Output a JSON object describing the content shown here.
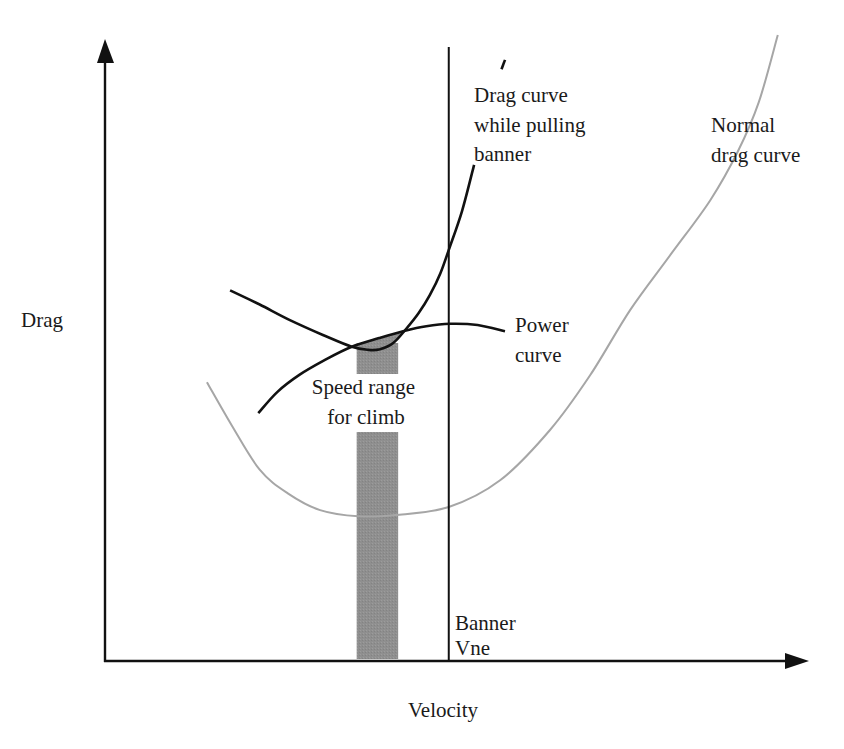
{
  "chart_data": {
    "type": "line",
    "title": "",
    "xlabel": "Velocity",
    "ylabel": "Drag",
    "xlim": [
      0,
      100
    ],
    "ylim": [
      0,
      100
    ],
    "grid": false,
    "ticks": "none",
    "series": [
      {
        "name": "Normal drag curve",
        "label_lines": [
          "Normal",
          "drag curve"
        ],
        "color": "#a6a6a6",
        "points": [
          [
            14.5,
            44.9
          ],
          [
            18,
            38
          ],
          [
            22,
            30.8
          ],
          [
            26,
            27
          ],
          [
            30.6,
            24.3
          ],
          [
            36,
            23.3
          ],
          [
            41.3,
            23.5
          ],
          [
            48.9,
            24.8
          ],
          [
            56.2,
            29.1
          ],
          [
            63.3,
            37.2
          ],
          [
            69,
            46
          ],
          [
            74.7,
            56.5
          ],
          [
            80.5,
            65.5
          ],
          [
            86.1,
            74.2
          ],
          [
            90,
            82
          ],
          [
            93,
            90
          ],
          [
            95.7,
            100.8
          ]
        ]
      },
      {
        "name": "Drag curve while pulling banner",
        "label_lines": [
          "Drag curve",
          "while pulling",
          "banner"
        ],
        "color": "#111111",
        "points": [
          [
            17.8,
            59.7
          ],
          [
            22,
            57.4
          ],
          [
            26.3,
            54.9
          ],
          [
            31,
            52.5
          ],
          [
            35.1,
            50.6
          ],
          [
            37.5,
            50.1
          ],
          [
            39.1,
            50.2
          ],
          [
            41,
            51.2
          ],
          [
            42.7,
            53.3
          ],
          [
            44.6,
            56
          ],
          [
            46.2,
            58.9
          ],
          [
            47.7,
            62.4
          ],
          [
            48.9,
            66.2
          ],
          [
            50.8,
            72.5
          ],
          [
            52.5,
            79.9
          ]
        ],
        "extra_segment": [
          [
            56.4,
            95.3
          ],
          [
            56.9,
            96.8
          ]
        ]
      },
      {
        "name": "Power curve",
        "label_lines": [
          "Power",
          "curve"
        ],
        "color": "#111111",
        "points": [
          [
            21.8,
            39.9
          ],
          [
            24.5,
            43.3
          ],
          [
            27.7,
            46.1
          ],
          [
            31.5,
            48.6
          ],
          [
            35.1,
            50.6
          ],
          [
            39,
            52
          ],
          [
            42.4,
            53.1
          ],
          [
            45.7,
            53.9
          ],
          [
            49.1,
            54.3
          ],
          [
            53,
            54.1
          ],
          [
            56.9,
            53.1
          ]
        ]
      }
    ],
    "vertical_line": {
      "name": "Banner Vne",
      "label_lines": [
        "Banner",
        "Vne"
      ],
      "x": 48.9
    },
    "shaded_band": {
      "name": "Speed range for climb",
      "label_lines": [
        "Speed range",
        "for climb"
      ],
      "x_range": [
        35.8,
        41.7
      ],
      "color": "#8c8c8c"
    }
  }
}
